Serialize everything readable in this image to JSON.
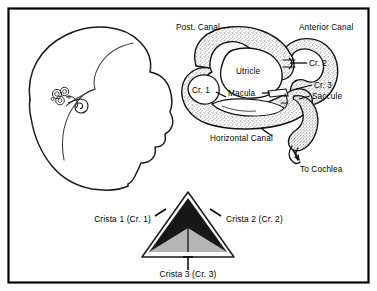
{
  "figure": {
    "title_visible": false,
    "background_color": "#ffffff",
    "frame": {
      "name": "figure-border",
      "color": "#000000",
      "style": "solid rectangle border"
    },
    "panels": [
      {
        "id": "head-profile",
        "label_text": "",
        "description": "Lateral outline of a human head facing right with inner ear shown in situ"
      },
      {
        "id": "labyrinth",
        "label_text": "",
        "description": "Membranous labyrinth with semicircular canals, utricle, saccule and cristae"
      },
      {
        "id": "crista-triangle",
        "label_text": "",
        "description": "Triangle schematic of the three cristae planes"
      }
    ]
  },
  "labyrinth_labels": {
    "post_canal": "Post. Canal",
    "anterior_canal": "Anterior Canal",
    "horizontal_canal": "Horizontal Canal",
    "utricle": "Utricle",
    "macula": "Macula",
    "saccule": "Saccule",
    "cr1": "Cr. 1",
    "cr2": "Cr. 2",
    "cr3": "Cr. 3",
    "to_cochlea": "To Cochlea"
  },
  "triangle_labels": {
    "crista1": "Crista 1 (Cr. 1)",
    "crista2": "Crista 2 (Cr. 2)",
    "crista3": "Crista 3 (Cr. 3)"
  },
  "colors": {
    "ink": "#000000",
    "paper": "#ffffff",
    "stipple": "#b9b9b9",
    "stipple_light": "#d8d8d8",
    "triangle_dark": "#161616",
    "triangle_gray": "#b3b3b3",
    "triangle_fill": "#f7f7f7"
  }
}
